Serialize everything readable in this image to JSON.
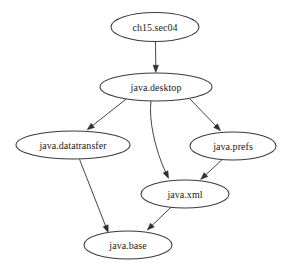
{
  "diagram": {
    "type": "directed-graph",
    "background_color": "#ffffff",
    "node_fill_color": "#ffffff",
    "node_stroke_color": "#3a3a3a",
    "edge_color": "#3a3a3a",
    "label_color": "#1a1a1a",
    "nodes": [
      {
        "id": "ch15sec04",
        "label": "ch15.sec04",
        "cx": 155,
        "cy": 27,
        "rx": 44,
        "ry": 14.5
      },
      {
        "id": "javadesktop",
        "label": "java.desktop",
        "cx": 156,
        "cy": 87,
        "rx": 56,
        "ry": 14
      },
      {
        "id": "javadatatransfer",
        "label": "java.datatransfer",
        "cx": 73,
        "cy": 145,
        "rx": 57,
        "ry": 14
      },
      {
        "id": "javaprefs",
        "label": "java.prefs",
        "cx": 233,
        "cy": 146,
        "rx": 43,
        "ry": 14
      },
      {
        "id": "javaxml",
        "label": "java.xml",
        "cx": 185,
        "cy": 194,
        "rx": 44,
        "ry": 14
      },
      {
        "id": "javabase",
        "label": "java.base",
        "cx": 128,
        "cy": 245,
        "rx": 44,
        "ry": 14
      }
    ],
    "edges": [
      {
        "id": "e1",
        "from": "ch15sec04",
        "to": "javadesktop",
        "path": "M 155.5 41.8 L 155.8 66.5",
        "arrow_x": 155.8,
        "arrow_y": 72.4,
        "arrow_angle": 90
      },
      {
        "id": "e2",
        "from": "javadesktop",
        "to": "javadatatransfer",
        "path": "M 126.0 99.2 L 92.0 126.0",
        "arrow_x": 87.2,
        "arrow_y": 129.8,
        "arrow_angle": 141.7
      },
      {
        "id": "e3",
        "from": "javadesktop",
        "to": "javaxml",
        "path": "M 151.0 101.1 C 148.5 119.0 155.0 150.0 166.0 173.0",
        "arrow_x": 168.6,
        "arrow_y": 178.4,
        "arrow_angle": 64.4
      },
      {
        "id": "e4",
        "from": "javadesktop",
        "to": "javaprefs",
        "path": "M 190.0 99.0 L 216.5 126.5",
        "arrow_x": 220.6,
        "arrow_y": 130.8,
        "arrow_angle": 46.0
      },
      {
        "id": "e5",
        "from": "javadatatransfer",
        "to": "javabase",
        "path": "M 79.5 159.3 L 106.0 227.0",
        "arrow_x": 108.2,
        "arrow_y": 232.5,
        "arrow_angle": 68.6
      },
      {
        "id": "e6",
        "from": "javaprefs",
        "to": "javaxml",
        "path": "M 223.0 158.8 L 205.0 175.5",
        "arrow_x": 200.7,
        "arrow_y": 179.5,
        "arrow_angle": 137.1
      },
      {
        "id": "e7",
        "from": "javaxml",
        "to": "javabase",
        "path": "M 172.0 206.2 L 151.5 226.0",
        "arrow_x": 147.2,
        "arrow_y": 230.1,
        "arrow_angle": 136.0
      }
    ]
  }
}
